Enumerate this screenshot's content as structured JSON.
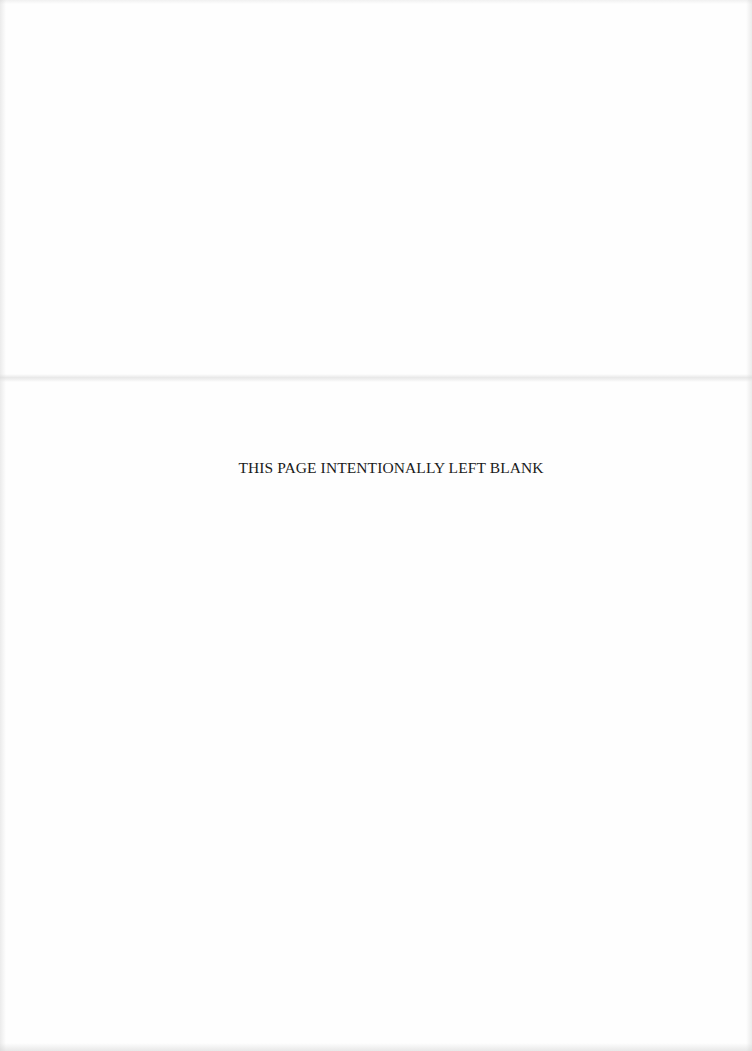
{
  "page": {
    "notice_text": "THIS PAGE INTENTIONALLY LEFT BLANK",
    "background_color": "#fefefe",
    "text_color": "#1a1a1a"
  }
}
